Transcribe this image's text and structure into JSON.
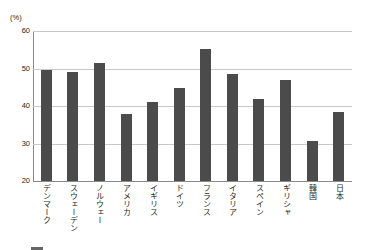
{
  "chart_data": {
    "type": "bar",
    "title": "",
    "subtitle": "",
    "unit_label": "(%)",
    "xlabel": "",
    "ylabel": "",
    "ylim": [
      20,
      60
    ],
    "yticks": [
      20,
      30,
      40,
      50,
      60
    ],
    "grid": true,
    "legend_position": "none",
    "bar_color": "#4b4b4b",
    "gridline_color": "#c9c9c9",
    "axis_color": "#8a8a8a",
    "categories": [
      "デンマーク",
      "スウェーデン",
      "ノルウェー",
      "アメリカ",
      "イギリス",
      "ドイツ",
      "フランス",
      "イタリア",
      "スペイン",
      "ギリシャ",
      "韓国",
      "日本"
    ],
    "values": [
      49.7,
      49.0,
      51.6,
      37.8,
      41.0,
      44.7,
      55.2,
      48.6,
      41.8,
      46.9,
      30.8,
      38.4
    ]
  },
  "footer": {
    "caption": ""
  }
}
